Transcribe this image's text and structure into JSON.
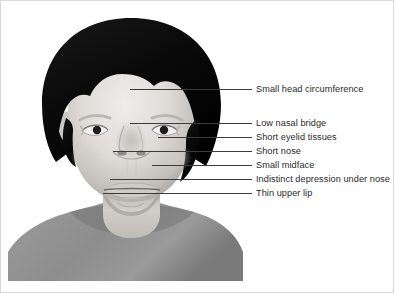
{
  "figure": {
    "style": "grayscale medical illustration",
    "colors": {
      "background": "#ffffff",
      "hair": "#0d0d0d",
      "skin_light": "#e8e6e3",
      "skin_mid": "#c9c6c2",
      "skin_shadow": "#a9a6a2",
      "shirt": "#8e8e8e",
      "shirt_shadow": "#6f6f6f",
      "leader_line": "#3a3a3a",
      "label_text": "#2a2a2a"
    }
  },
  "annotations": [
    {
      "id": "small-head-circumference",
      "label": "Small head circumference",
      "line": {
        "x1": 130,
        "y1": 89,
        "x2": 252,
        "y2": 89
      },
      "text": {
        "x": 256,
        "y": 84
      }
    },
    {
      "id": "low-nasal-bridge",
      "label": "Low nasal bridge",
      "line": {
        "x1": 130,
        "y1": 123,
        "x2": 252,
        "y2": 123
      },
      "text": {
        "x": 256,
        "y": 118
      }
    },
    {
      "id": "short-eyelid-tissues",
      "label": "Short eyelid tissues",
      "line": {
        "x1": 158,
        "y1": 137,
        "x2": 252,
        "y2": 137
      },
      "text": {
        "x": 256,
        "y": 132
      }
    },
    {
      "id": "short-nose",
      "label": "Short nose",
      "line": {
        "x1": 113,
        "y1": 151,
        "x2": 252,
        "y2": 151
      },
      "text": {
        "x": 256,
        "y": 146
      }
    },
    {
      "id": "small-midface",
      "label": "Small midface",
      "line": {
        "x1": 152,
        "y1": 165,
        "x2": 252,
        "y2": 165
      },
      "text": {
        "x": 256,
        "y": 160
      }
    },
    {
      "id": "indistinct-depression-under-nose",
      "label": "Indistinct depression under nose",
      "line": {
        "x1": 110,
        "y1": 179,
        "x2": 252,
        "y2": 179
      },
      "text": {
        "x": 256,
        "y": 174
      }
    },
    {
      "id": "thin-upper-lip",
      "label": "Thin upper lip",
      "line": {
        "x1": 103,
        "y1": 193,
        "x2": 252,
        "y2": 193
      },
      "text": {
        "x": 256,
        "y": 188
      }
    }
  ]
}
